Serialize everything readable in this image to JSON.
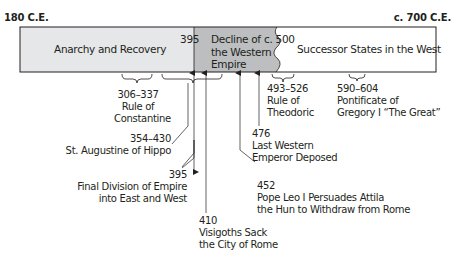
{
  "timeline": {
    "start_label": "180 C.E.",
    "end_label": "c. 700 C.E.",
    "periods": [
      {
        "label": "Anarchy and Recovery",
        "color": "#e6e7e8"
      },
      {
        "label_lines": [
          "Decline of",
          "the Western",
          "Empire"
        ],
        "color": "#bcbec0"
      },
      {
        "label": "Successor States in the West",
        "color": "#ffffff"
      }
    ],
    "dividers": [
      {
        "label": "395"
      },
      {
        "label": "c. 500"
      }
    ]
  },
  "events": [
    {
      "date": "306–337",
      "lines": [
        "Rule of",
        "Constantine"
      ]
    },
    {
      "date": "354–430",
      "lines": [
        "St. Augustine of Hippo"
      ]
    },
    {
      "date": "395",
      "lines": [
        "Final Division of Empire",
        "into East and West"
      ]
    },
    {
      "date": "410",
      "lines": [
        "Visigoths Sack",
        "the City of Rome"
      ]
    },
    {
      "date": "452",
      "lines": [
        "Pope Leo I Persuades Attila",
        "the Hun to Withdraw from Rome"
      ]
    },
    {
      "date": "476",
      "lines": [
        "Last Western",
        "Emperor Deposed"
      ]
    },
    {
      "date": "493–526",
      "lines": [
        "Rule of",
        "Theodoric"
      ]
    },
    {
      "date": "590–604",
      "lines": [
        "Pontificate of",
        "Gregory I “The Great”"
      ]
    }
  ]
}
